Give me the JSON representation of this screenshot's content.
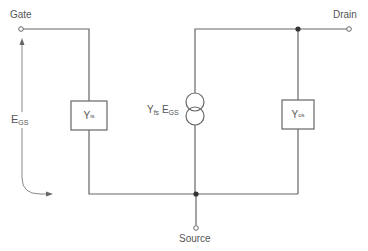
{
  "diagram": {
    "colors": {
      "wire": "#666666",
      "text": "#555555",
      "background": "#ffffff"
    },
    "terminals": {
      "gate": {
        "label": "Gate"
      },
      "drain": {
        "label": "Drain"
      },
      "source": {
        "label": "Source"
      }
    },
    "voltage": {
      "symbol": "E",
      "subscript": "GS"
    },
    "components": {
      "input_admittance": {
        "symbol": "Y",
        "subscript": "is"
      },
      "current_source": {
        "symbol": "Y",
        "subscript": "fs",
        "multiplier_symbol": "E",
        "multiplier_subscript": "GS"
      },
      "output_admittance": {
        "symbol": "Y",
        "subscript": "os"
      }
    }
  }
}
